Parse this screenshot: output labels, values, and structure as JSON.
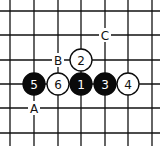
{
  "board": {
    "grid_x": [
      10,
      34,
      58,
      81,
      105,
      128,
      152
    ],
    "grid_y": [
      11,
      35,
      60,
      84,
      108,
      133
    ],
    "line_color": "#111111",
    "background": "#ffffff"
  },
  "stones": [
    {
      "label": "1",
      "color": "black",
      "col": 3,
      "row": 3
    },
    {
      "label": "2",
      "color": "white",
      "col": 3,
      "row": 2
    },
    {
      "label": "3",
      "color": "black",
      "col": 4,
      "row": 3
    },
    {
      "label": "4",
      "color": "white",
      "col": 5,
      "row": 3
    },
    {
      "label": "5",
      "color": "black",
      "col": 1,
      "row": 3
    },
    {
      "label": "6",
      "color": "white",
      "col": 2,
      "row": 3
    }
  ],
  "markers": [
    {
      "label": "A",
      "col": 1,
      "row": 4
    },
    {
      "label": "B",
      "col": 2,
      "row": 2
    },
    {
      "label": "C",
      "col": 4,
      "row": 1
    }
  ]
}
